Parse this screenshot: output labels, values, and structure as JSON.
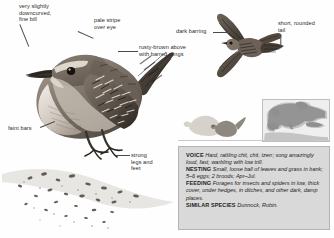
{
  "species": {
    "common_name": "Wren"
  },
  "callouts": [
    {
      "id": "bill",
      "text": "very slightly\ndowncurved,\nfine bill"
    },
    {
      "id": "stripe",
      "text": "pale stripe\nover eye"
    },
    {
      "id": "barring",
      "text": "dark barring"
    },
    {
      "id": "tail",
      "text": "short, rounded\ntail"
    },
    {
      "id": "upper",
      "text": "rusty-brown above\nwith barred wings"
    },
    {
      "id": "faint",
      "text": "faint bars"
    },
    {
      "id": "legs",
      "text": "strong\nlegs and\nfeet"
    }
  ],
  "info": {
    "voice": {
      "heading": "VOICE",
      "text": "Hard, rattling chit, chit, tzerr; song amazingly loud, fast, warbling with low trill."
    },
    "nesting": {
      "heading": "NESTING",
      "text": "Small, loose ball of leaves and grass in bank; 5–6 eggs; 2 broods; Apr–Jul."
    },
    "feeding": {
      "heading": "FEEDING",
      "text": "Forages for insects and spiders in low, thick cover, under hedges, in ditches, and other dark, damp places."
    },
    "similar": {
      "heading": "SIMILAR SPECIES",
      "text": "Dunnock, Robin."
    }
  },
  "figures": {
    "perched_bird": "perched-wren-illustration",
    "flight_bird": "wren-in-flight-illustration",
    "size_silhouettes": "size-comparison-silhouettes",
    "branch": "mossy-branch-perch"
  },
  "map": {
    "name": "europe-distribution-map",
    "range_color": "#8f8f8f",
    "land_color": "#c4c4c4",
    "sea_color": "#efefef"
  },
  "colors": {
    "panel_bg": "#d9d9d9",
    "panel_border": "#b4b4b4",
    "text": "#1d1d1d",
    "label_text": "#2b2b2b",
    "leader": "#4a4a4a"
  }
}
